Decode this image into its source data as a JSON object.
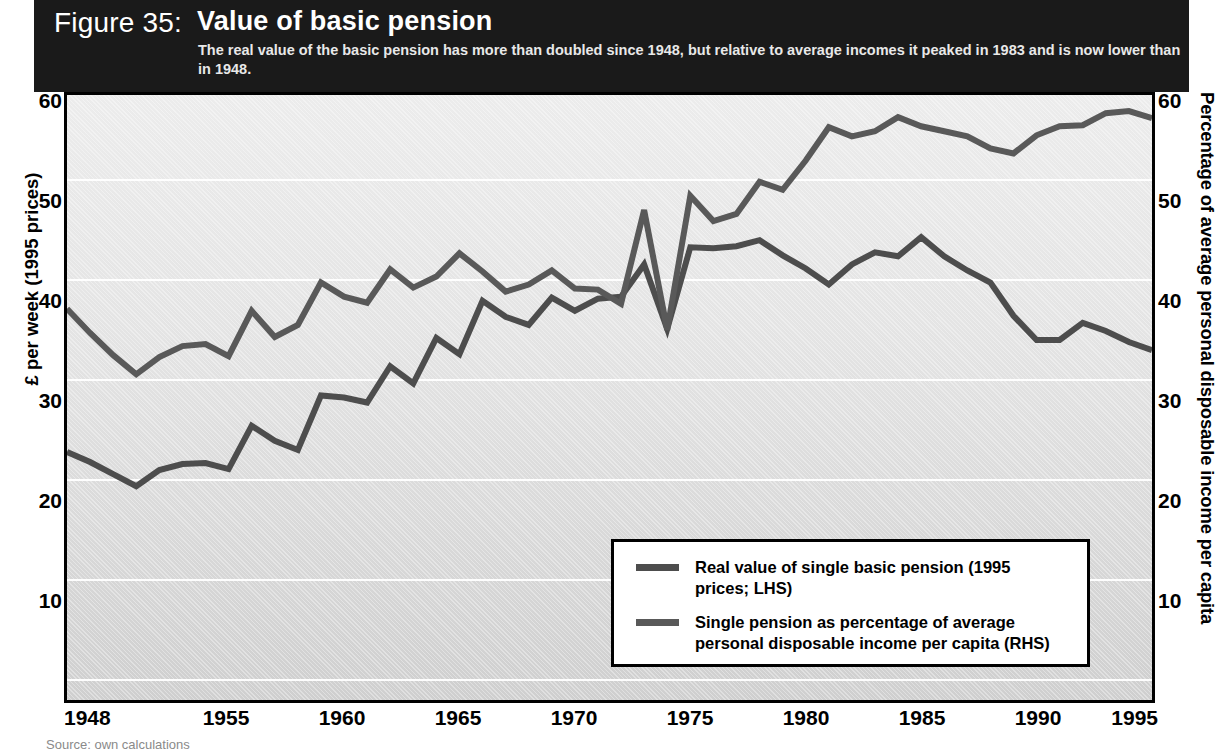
{
  "header": {
    "figure_number": "Figure 35:",
    "title": "Value of basic pension",
    "subtitle": "The real value of the basic pension has more than doubled since 1948, but relative to average incomes it peaked in 1983 and is now lower than in 1948."
  },
  "axes": {
    "left_title": "£ per week (1995 prices)",
    "right_title": "Percentage of average personal disposable income per capita",
    "yticks": [
      "60",
      "50",
      "40",
      "30",
      "20",
      "10"
    ],
    "xticks": [
      "1948",
      "1955",
      "1960",
      "1965",
      "1970",
      "1975",
      "1980",
      "1985",
      "1990",
      "1995"
    ]
  },
  "legend": {
    "entries": [
      {
        "label": "Real value of single basic pension (1995 prices; LHS)",
        "color": "#4d4d4d"
      },
      {
        "label": "Single pension as percentage of average personal disposable income per capita (RHS)",
        "color": "#595959"
      }
    ]
  },
  "source": "Source: own calculations",
  "colors": {
    "header_band": "#1a1a1a",
    "plot_background": "#e4e4e4",
    "gridline": "#ffffff",
    "series_1": "#4d4d4d",
    "series_2": "#595959",
    "axis": "#000000"
  },
  "chart_data": {
    "type": "line",
    "title": "Value of basic pension",
    "subtitle": "The real value of the basic pension has more than doubled since 1948, but relative to average incomes it peaked in 1983 and is now lower than in 1948.",
    "xlabel": "",
    "ylabel": "£ per week (1995 prices)",
    "y2label": "Percentage of average personal disposable income per capita",
    "xlim": [
      1948,
      1995
    ],
    "ylim": [
      0,
      60
    ],
    "y2lim": [
      0,
      60
    ],
    "yticks": [
      10,
      20,
      30,
      40,
      50,
      60
    ],
    "grid": true,
    "legend_position": "inside-lower-right",
    "x": [
      1948,
      1949,
      1950,
      1951,
      1952,
      1953,
      1954,
      1955,
      1956,
      1957,
      1958,
      1959,
      1960,
      1961,
      1962,
      1963,
      1964,
      1965,
      1966,
      1967,
      1968,
      1969,
      1970,
      1971,
      1972,
      1973,
      1974,
      1975,
      1976,
      1977,
      1978,
      1979,
      1980,
      1981,
      1982,
      1983,
      1984,
      1985,
      1986,
      1987,
      1988,
      1989,
      1990,
      1991,
      1992,
      1993,
      1994,
      1995
    ],
    "series": [
      {
        "name": "Real value of single basic pension (1995 prices; LHS)",
        "axis": "right",
        "color": "#4d4d4d",
        "values": [
          24.6,
          23.6,
          22.4,
          21.2,
          22.8,
          23.4,
          23.5,
          22.9,
          27.2,
          25.7,
          24.8,
          30.2,
          30.0,
          29.5,
          33.1,
          31.4,
          35.9,
          34.3,
          39.6,
          38.0,
          37.2,
          39.9,
          38.6,
          39.8,
          40.0,
          43.2,
          36.8,
          44.9,
          44.8,
          45.0,
          45.6,
          44.1,
          42.8,
          41.2,
          43.2,
          44.4,
          44.0,
          45.9,
          44.0,
          42.6,
          41.4,
          38.1,
          35.7,
          35.7,
          37.4,
          36.6,
          35.5,
          34.7
        ]
      },
      {
        "name": "Single pension as percentage of average personal disposable income per capita (RHS)",
        "axis": "left",
        "color": "#595959",
        "values": [
          38.8,
          36.4,
          34.2,
          32.3,
          34.0,
          35.1,
          35.3,
          34.1,
          38.6,
          36.0,
          37.2,
          41.4,
          40.0,
          39.4,
          42.7,
          40.9,
          42.0,
          44.3,
          42.5,
          40.5,
          41.2,
          42.6,
          40.8,
          40.7,
          39.3,
          48.6,
          36.7,
          50.0,
          47.5,
          48.2,
          51.4,
          50.6,
          53.5,
          56.8,
          55.9,
          56.4,
          57.8,
          56.9,
          56.4,
          55.9,
          54.7,
          54.2,
          56.0,
          56.9,
          57.0,
          58.2,
          58.4,
          57.7
        ]
      }
    ]
  }
}
